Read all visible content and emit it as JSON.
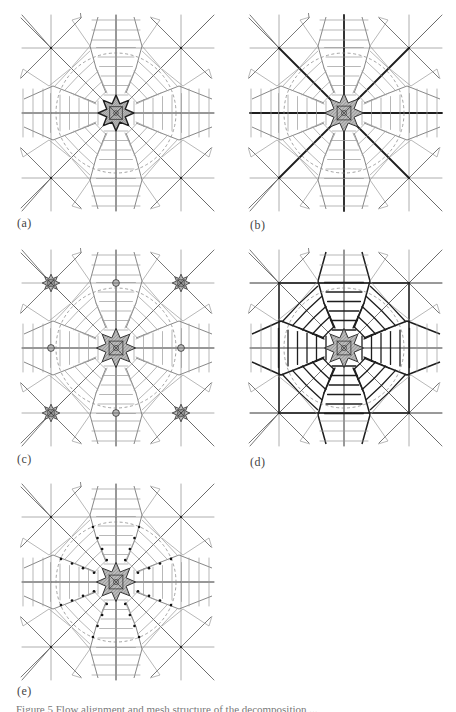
{
  "figure": {
    "panels": [
      {
        "id": "a",
        "label": "(a)",
        "left": 20,
        "top": 13,
        "label_left": 17,
        "label_top": 216,
        "variant": "dense-center"
      },
      {
        "id": "b",
        "label": "(b)",
        "left": 248,
        "top": 13,
        "label_left": 250,
        "label_top": 218,
        "variant": "thick-spokes"
      },
      {
        "id": "c",
        "label": "(c)",
        "left": 20,
        "top": 248,
        "label_left": 17,
        "label_top": 452,
        "variant": "multi-singular"
      },
      {
        "id": "d",
        "label": "(d)",
        "left": 248,
        "top": 248,
        "label_left": 250,
        "label_top": 455,
        "variant": "thick-block"
      },
      {
        "id": "e",
        "label": "(e)",
        "left": 20,
        "top": 482,
        "label_left": 17,
        "label_top": 684,
        "variant": "dots"
      }
    ],
    "caption": "Figure 5  Flow alignment and mesh structure of the decomposition ..."
  },
  "colors": {
    "line": "#6a6a6a",
    "thick": "#1e1e1e",
    "light": "#9a9a9a",
    "dashed": "#8a8a8a",
    "hatch": "#555555",
    "star_fill": "#bdbdbd"
  }
}
